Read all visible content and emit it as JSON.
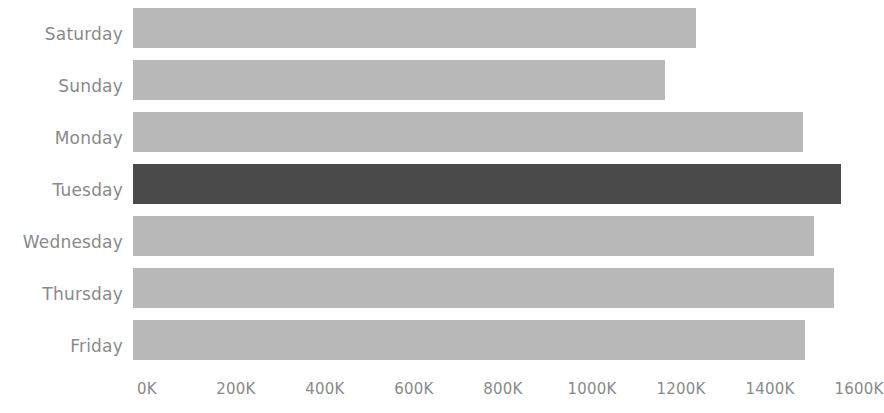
{
  "chart_data": {
    "type": "bar",
    "orientation": "horizontal",
    "title": "",
    "subtitle": "",
    "xlabel": "",
    "ylabel": "",
    "categories": [
      "Saturday",
      "Sunday",
      "Monday",
      "Tuesday",
      "Wednesday",
      "Thursday",
      "Friday"
    ],
    "values": [
      1265000,
      1195000,
      1505000,
      1590000,
      1530000,
      1575000,
      1510000
    ],
    "value_labels": [
      "1265K",
      "1195K",
      "1505K",
      "1590K",
      "1530K",
      "1575K",
      "1510K"
    ],
    "series": [
      {
        "name": "Value",
        "values": [
          1265000,
          1195000,
          1505000,
          1590000,
          1530000,
          1575000,
          1510000
        ]
      }
    ],
    "xlim": [
      0,
      1600000
    ],
    "ylim": null,
    "x_tick_values": [
      0,
      200000,
      400000,
      600000,
      800000,
      1000000,
      1200000,
      1400000,
      1600000
    ],
    "x_tick_labels": [
      "0K",
      "200K",
      "400K",
      "600K",
      "800K",
      "1000K",
      "1200K",
      "1400K",
      "1600K"
    ],
    "grid": false,
    "legend": false,
    "legend_position": "none",
    "highlighted_category": "Tuesday",
    "bar_colors": [
      "#b9b9b9",
      "#b9b9b9",
      "#b9b9b9",
      "#4a4a4a",
      "#b9b9b9",
      "#b9b9b9",
      "#b9b9b9"
    ]
  },
  "style": {
    "background_color": "#ffffff",
    "bar_color_default": "#b9b9b9",
    "bar_color_highlight": "#4a4a4a",
    "tick_label_color": "#8a8a8a",
    "category_label_color": "#8a8a8a"
  }
}
